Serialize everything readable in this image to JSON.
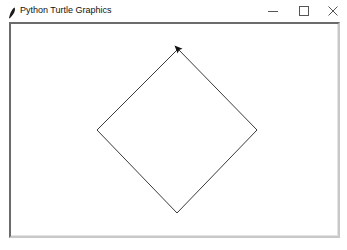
{
  "window": {
    "title": "Python Turtle Graphics",
    "icon": "feather-icon",
    "controls": {
      "minimize": "minimize-icon",
      "maximize": "maximize-icon",
      "close": "close-icon"
    }
  },
  "canvas": {
    "background": "#ffffff",
    "shape": {
      "type": "diamond",
      "stroke": "#333333",
      "vertices": {
        "top": [
          178,
          49
        ],
        "right": [
          257,
          130
        ],
        "bottom": [
          177,
          213
        ],
        "left": [
          97,
          130
        ]
      }
    },
    "turtle": {
      "shape": "classic-arrow",
      "position": [
        178,
        49
      ],
      "heading": "up-left",
      "color": "#111111"
    }
  }
}
